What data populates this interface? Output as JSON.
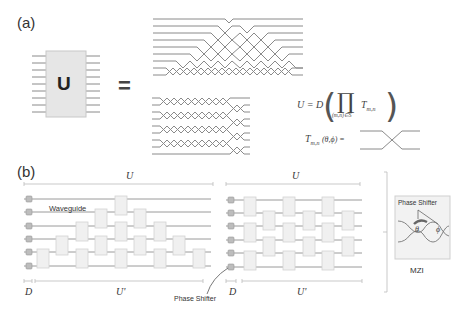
{
  "panel_a": {
    "label": "(a)",
    "unitary_symbol": "U",
    "equals": "=",
    "num_modes": 8,
    "equation": {
      "lhs": "U = D",
      "product_symbol": "∏",
      "product_subscript": "(m,n)∈S",
      "term": "T",
      "term_subscript": "m,n"
    },
    "transfer_definition": {
      "symbol": "T",
      "subscript": "m,n",
      "args": "(θ,ϕ) ="
    }
  },
  "panel_b": {
    "label": "(b)",
    "mesh_left": {
      "top_bracket_label": "U",
      "bottom_left_label": "D",
      "bottom_right_label": "U'",
      "waveguide_label": "Waveguide"
    },
    "mesh_right": {
      "top_bracket_label": "U",
      "bottom_left_label": "D",
      "bottom_right_label": "U'"
    },
    "phase_shifter_label": "Phase Shifter",
    "mzi": {
      "inset_title": "Phase Shifter",
      "theta": "θ",
      "phi": "ϕ",
      "caption": "MZI"
    }
  },
  "colors": {
    "line": "#8a8a8a",
    "box_fill": "#efefef",
    "box_stroke": "#d0d0d0",
    "phase_fill": "#bdbdbd",
    "text": "#333333"
  }
}
